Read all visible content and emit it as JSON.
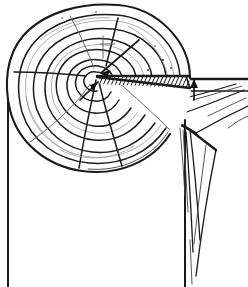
{
  "figure": {
    "caption": "",
    "medium": "pen-and-ink line drawing",
    "background_color": "#ffffff",
    "ink_color": "#1a1a1a",
    "canvas": {
      "width": 248,
      "height": 287
    }
  },
  "labels": {
    "log_end": "",
    "saw_kerf": "",
    "plank": "",
    "trunk": "",
    "arrow": ""
  },
  "geometry": {
    "log": {
      "center_x": 99,
      "center_y": 88,
      "radius_x": 92,
      "radius_y": 83,
      "pith_x": 100,
      "pith_y": 77
    },
    "growth_rings": 7,
    "radial_cracks": 6,
    "kerf": {
      "apex_x": 97,
      "apex_y": 76,
      "hatch_lines": 26,
      "hatch_angle_deg": 58
    },
    "trunk": {
      "left_x": 8,
      "right_x": 185,
      "bottom_y": 287
    },
    "plank": {
      "top_y": 78,
      "right_x": 248,
      "grain_lines": 9
    }
  },
  "annotations": []
}
